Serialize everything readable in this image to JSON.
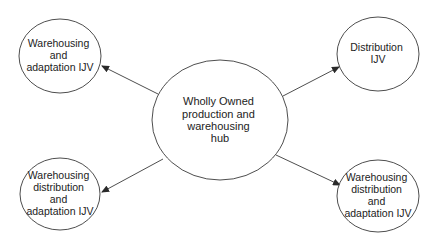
{
  "diagram": {
    "type": "hub-and-spoke",
    "colors": {
      "background": "#ffffff",
      "stroke": "#3a3a3a",
      "text": "#222222"
    },
    "hub": {
      "id": "hub",
      "lines": [
        "Wholly Owned",
        "production and",
        "warehousing",
        "hub"
      ]
    },
    "nodes": [
      {
        "id": "top-left",
        "lines": [
          "Warehousing",
          "and",
          "adaptation IJV"
        ]
      },
      {
        "id": "top-right",
        "lines": [
          "Distribution",
          "IJV"
        ]
      },
      {
        "id": "bottom-left",
        "lines": [
          "Warehousing",
          "distribution",
          "and",
          "adaptation IJV"
        ]
      },
      {
        "id": "bottom-right",
        "lines": [
          "Warehousing",
          "distribution",
          "and",
          "adaptation IJV"
        ]
      }
    ],
    "edges": [
      {
        "from": "hub",
        "to": "top-left",
        "arrow": "end"
      },
      {
        "from": "hub",
        "to": "top-right",
        "arrow": "end"
      },
      {
        "from": "hub",
        "to": "bottom-left",
        "arrow": "end"
      },
      {
        "from": "hub",
        "to": "bottom-right",
        "arrow": "end"
      }
    ]
  }
}
